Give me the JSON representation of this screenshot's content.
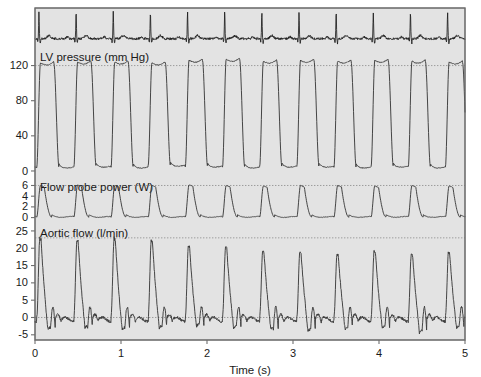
{
  "figure": {
    "background": "#e3e3e3",
    "trace_color": "#3c3c3c",
    "ecg_color": "#1c1c1c",
    "axis_color": "#6e6e6e",
    "grid_color": "#8a8a8a",
    "plot_left": 35,
    "plot_right": 465,
    "plot_top": 8,
    "plot_bottom": 340
  },
  "xaxis": {
    "title": "Time (s)",
    "ticks": [
      0,
      1,
      2,
      3,
      4,
      5
    ],
    "tick_labels": [
      "0",
      "1",
      "2",
      "3",
      "4",
      "5"
    ],
    "min": 0,
    "max": 5
  },
  "panels": [
    {
      "name": "ecg",
      "label": "",
      "y_top": 8,
      "y_bottom": 48,
      "ymin": -0.35,
      "ymax": 1.15,
      "ticks": [],
      "tick_labels": [],
      "gridlines": []
    },
    {
      "name": "lv-pressure",
      "label": "LV pressure (mm Hg)",
      "y_top": 48,
      "y_bottom": 178,
      "ymin": -8,
      "ymax": 140,
      "ticks": [
        0,
        40,
        80,
        120
      ],
      "tick_labels": [
        "0",
        "40",
        "80",
        "120"
      ],
      "gridlines": [
        120
      ]
    },
    {
      "name": "flow-probe-power",
      "label": "Flow probe power (W)",
      "y_top": 178,
      "y_bottom": 224,
      "ymin": -1.2,
      "ymax": 7.4,
      "ticks": [
        0,
        2,
        4,
        6
      ],
      "tick_labels": [
        "0",
        "2",
        "4",
        "6"
      ],
      "gridlines": [
        6
      ]
    },
    {
      "name": "aortic-flow",
      "label": "Aortic flow (l/min)",
      "y_top": 224,
      "y_bottom": 340,
      "ymin": -6.5,
      "ymax": 27,
      "ticks": [
        -5,
        0,
        5,
        10,
        15,
        20,
        25
      ],
      "tick_labels": [
        "-5",
        "0",
        "5",
        "10",
        "15",
        "20",
        "25"
      ],
      "gridlines": [
        23,
        0
      ]
    }
  ],
  "chart_data": {
    "type": "line",
    "title": "",
    "xlabel": "Time (s)",
    "ylabel": "",
    "xlim": [
      0,
      5
    ],
    "grid": true,
    "legend": "none",
    "beat_period_s": 0.432,
    "first_beat_start_s": 0.02,
    "n_beats": 12,
    "series": [
      {
        "name": "ECG",
        "units": "",
        "ylim": [
          -0.35,
          1.15
        ],
        "description": "Electrocardiogram with sharp R-wave spikes and low-amplitude noisy baseline",
        "r_wave_amplitude": 1.0,
        "baseline_noise": 0.06
      },
      {
        "name": "LV pressure",
        "units": "mm Hg",
        "ylim": [
          -8,
          140
        ],
        "systolic_peak": 125,
        "diastolic_trough": 4,
        "plateau_shape": "rounded square",
        "peak_values": [
          123,
          124,
          124,
          123,
          126,
          127,
          125,
          126,
          125,
          126,
          125,
          124
        ],
        "trough_values": [
          4,
          5,
          4,
          6,
          5,
          4,
          5,
          5,
          4,
          5,
          4,
          5
        ]
      },
      {
        "name": "Flow probe power",
        "units": "W",
        "ylim": [
          -1.2,
          7.4
        ],
        "peak": 6.0,
        "baseline": 0.1,
        "peak_values": [
          6.0,
          6.1,
          6.0,
          6.0,
          6.1,
          6.0,
          5.9,
          6.0,
          6.0,
          5.9,
          6.0,
          5.9
        ]
      },
      {
        "name": "Aortic flow",
        "units": "l/min",
        "ylim": [
          -6.5,
          27
        ],
        "systolic_peak": 23,
        "dicrotic_notch": -4,
        "peak_values": [
          23.0,
          22.5,
          23.0,
          22.5,
          21.0,
          20.5,
          19.5,
          19.0,
          18.5,
          19.5,
          18.5,
          19.0
        ],
        "notch_values": [
          -3.5,
          -3.0,
          -3.5,
          -3.0,
          -2.5,
          -3.0,
          -3.5,
          -4.0,
          -3.5,
          -3.0,
          -4.5,
          -3.0
        ],
        "secondary_bump": 3.0
      }
    ]
  }
}
